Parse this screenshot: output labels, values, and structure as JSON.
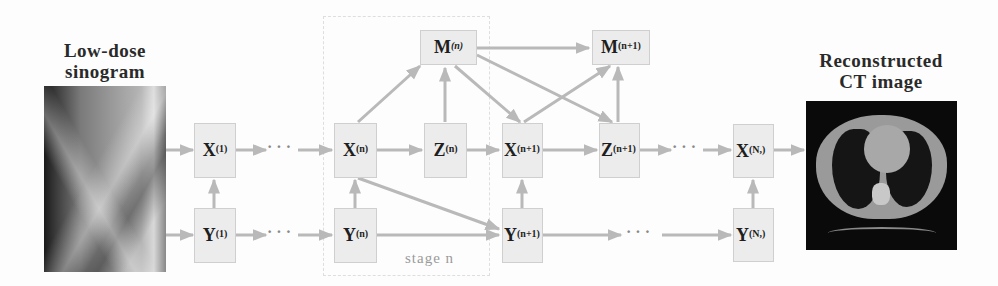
{
  "input": {
    "title_line1": "Low-dose",
    "title_line2": "sinogram",
    "image": "sinogram-image"
  },
  "output": {
    "title_line1": "Reconstructed",
    "title_line2": "CT image",
    "image": "ct-image"
  },
  "stage": {
    "label": "stage n"
  },
  "nodes": {
    "x1": {
      "base": "X",
      "sup": "(1)"
    },
    "y1": {
      "base": "Y",
      "sup": "(1)"
    },
    "xn": {
      "base": "X",
      "sup": "(n)"
    },
    "yn": {
      "base": "Y",
      "sup": "(n)"
    },
    "zn": {
      "base": "Z",
      "sup": "(n)"
    },
    "mn": {
      "base": "M",
      "sup": "(n)"
    },
    "xn1": {
      "base": "X",
      "sup": "(n+1)"
    },
    "yn1": {
      "base": "Y",
      "sup": "(n+1)"
    },
    "zn1": {
      "base": "Z",
      "sup": "(n+1)"
    },
    "mn1": {
      "base": "M",
      "sup": "(n+1)"
    },
    "xN": {
      "base": "X",
      "sup": "(N,)"
    },
    "yN": {
      "base": "Y",
      "sup": "(N,)"
    }
  },
  "ellipsis": "· · ·",
  "colors": {
    "arrow": "#b9b9b9",
    "box_fill": "#ececec",
    "box_border": "#cfcfcf",
    "title": "#2a2a2a",
    "stage_label": "#9a9a9a"
  }
}
